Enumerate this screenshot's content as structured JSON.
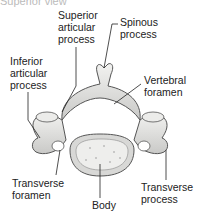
{
  "figure": {
    "top_cutoff_text": "Superior view",
    "labels": [
      {
        "id": "superior-articular-process",
        "lines": [
          "Superior",
          "articular",
          "process"
        ]
      },
      {
        "id": "spinous-process",
        "lines": [
          "Spinous",
          "process"
        ]
      },
      {
        "id": "inferior-articular-process",
        "lines": [
          "Inferior",
          "articular",
          "process"
        ]
      },
      {
        "id": "vertebral-foramen",
        "lines": [
          "Vertebral",
          "foramen"
        ]
      },
      {
        "id": "transverse-foramen",
        "lines": [
          "Transverse",
          "foramen"
        ]
      },
      {
        "id": "body",
        "lines": [
          "Body"
        ]
      },
      {
        "id": "transverse-process",
        "lines": [
          "Transverse",
          "process"
        ]
      }
    ],
    "colors": {
      "bone_fill": "#e4e4e2",
      "bone_shade": "#b8b8b6",
      "outline": "#555555",
      "leader": "#222222"
    }
  }
}
